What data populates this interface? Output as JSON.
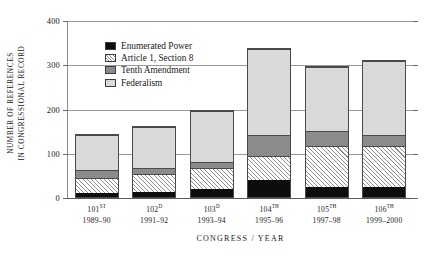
{
  "chart_data": {
    "type": "bar",
    "stacked": true,
    "title": "",
    "xlabel": "CONGRESS / YEAR",
    "ylabel_lines": [
      "NUMBER OF REFERENCES",
      "IN CONGRESSIONAL RECORD"
    ],
    "ylabel": "NUMBER OF REFERENCES IN CONGRESSIONAL RECORD",
    "ylim": [
      0,
      400
    ],
    "yticks": [
      0,
      100,
      200,
      300,
      400
    ],
    "ytick_labels": [
      "0",
      "100",
      "200",
      "300",
      "400"
    ],
    "grid": true,
    "legend_position": "upper-left-inside",
    "categories": [
      "101ST",
      "102D",
      "103D",
      "104TH",
      "105TH",
      "106TH"
    ],
    "category_ordinals": [
      "101",
      "102",
      "103",
      "104",
      "105",
      "106"
    ],
    "category_suffixes": [
      "ST",
      "D",
      "D",
      "TH",
      "TH",
      "TH"
    ],
    "category_years": [
      "1989–90",
      "1991–92",
      "1993–94",
      "1995–96",
      "1997–98",
      "1999–2000"
    ],
    "series": [
      {
        "name": "Enumerated Power",
        "color": "#0d0d0d",
        "values": [
          10,
          12,
          18,
          38,
          23,
          22
        ]
      },
      {
        "name": "Article 1, Section 8",
        "color": "#ffffff",
        "values": [
          34,
          42,
          48,
          55,
          95,
          95
        ]
      },
      {
        "name": "Tenth Amendment",
        "color": "#8b8b8b",
        "values": [
          18,
          13,
          16,
          49,
          33,
          26
        ]
      },
      {
        "name": "Federalism",
        "color": "#d9d9d9",
        "values": [
          83,
          96,
          117,
          197,
          147,
          169
        ]
      }
    ],
    "totals": [
      145,
      163,
      199,
      339,
      298,
      312
    ]
  },
  "legend": {
    "items": [
      {
        "label": "Enumerated Power",
        "swatch": "enumerated"
      },
      {
        "label": "Article 1, Section 8",
        "swatch": "article"
      },
      {
        "label": "Tenth Amendment",
        "swatch": "tenth"
      },
      {
        "label": "Federalism",
        "swatch": "federalism"
      }
    ]
  }
}
